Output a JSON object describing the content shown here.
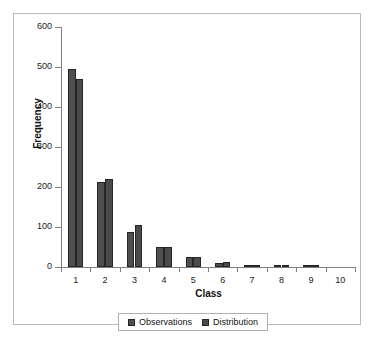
{
  "chart_data": {
    "type": "bar",
    "title": "",
    "subtitle": "",
    "xlabel": "Class",
    "ylabel": "Frequency",
    "categories": [
      "1",
      "2",
      "3",
      "4",
      "5",
      "6",
      "7",
      "8",
      "9",
      "10"
    ],
    "series": [
      {
        "name": "Observations",
        "color": "#4f4f4f",
        "values": [
          494,
          213,
          87,
          50,
          24,
          11,
          6,
          3,
          2,
          0
        ]
      },
      {
        "name": "Distribution",
        "color": "#4a4a4a",
        "values": [
          469,
          219,
          104,
          50,
          25,
          12,
          6,
          3,
          1,
          0
        ]
      }
    ],
    "ylim": [
      0,
      600
    ],
    "yticks": [
      0,
      100,
      200,
      300,
      400,
      500,
      600
    ],
    "ytick_labels": [
      "0",
      "100",
      "200",
      "300",
      "400",
      "500",
      "600"
    ],
    "grid": false,
    "legend_position": "bottom",
    "legend_entries": [
      "Observations",
      "Distribution"
    ],
    "border_color": "#b9b9b9",
    "axis_color": "#808080",
    "bar_outline_color": "#262626",
    "plot_background": "#ffffff"
  }
}
